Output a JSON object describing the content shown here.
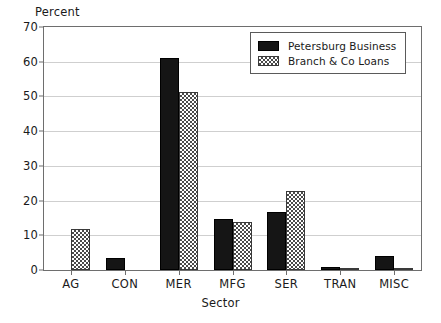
{
  "chart_data": {
    "type": "bar",
    "title": "",
    "subtitle": "",
    "xlabel": "Sector",
    "ylabel": "Percent",
    "categories": [
      "AG",
      "CON",
      "MER",
      "MFG",
      "SER",
      "TRAN",
      "MISC"
    ],
    "series": [
      {
        "name": "Petersburg Business",
        "values": [
          0,
          3.5,
          61.0,
          14.8,
          16.8,
          0.8,
          4.1
        ],
        "color": "#151515",
        "pattern": "solid"
      },
      {
        "name": "Branch & Co Loans",
        "values": [
          11.7,
          0,
          51.2,
          13.7,
          22.7,
          0.6,
          0.3
        ],
        "color": "#4a4a4a",
        "pattern": "checkered"
      }
    ],
    "ylim": [
      0,
      70
    ],
    "yticks": [
      0,
      10,
      20,
      30,
      40,
      50,
      60,
      70
    ],
    "ytick_labels": [
      "0",
      "10",
      "20",
      "30",
      "40",
      "50",
      "60",
      "70"
    ],
    "grid": true,
    "grid_axis": "y",
    "legend_position": "top-right",
    "legend": [
      "Petersburg Business",
      "Branch & Co Loans"
    ]
  }
}
